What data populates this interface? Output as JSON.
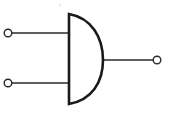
{
  "diagram": {
    "type": "logic-gate",
    "gate": "AND",
    "colors": {
      "stroke": "#1a1a1a",
      "background": "#ffffff"
    },
    "inputs": [
      {
        "name": "input-a",
        "y": 33
      },
      {
        "name": "input-b",
        "y": 83
      }
    ],
    "output": {
      "name": "output-q",
      "y": 60
    }
  }
}
